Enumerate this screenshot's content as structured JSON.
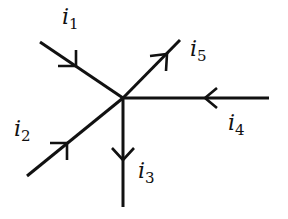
{
  "diagram": {
    "type": "circuit-node-currents",
    "stroke_color": "#111111",
    "junction": {
      "x": 123,
      "y": 98
    },
    "branches": [
      {
        "id": "i1",
        "symbol": "i",
        "subscript": "1",
        "direction": "into-node",
        "from": [
          40,
          42
        ],
        "to": [
          123,
          98
        ],
        "label_pos": [
          62,
          6
        ]
      },
      {
        "id": "i2",
        "symbol": "i",
        "subscript": "2",
        "direction": "into-node",
        "from": [
          27,
          176
        ],
        "to": [
          123,
          98
        ],
        "label_pos": [
          14,
          118
        ]
      },
      {
        "id": "i3",
        "symbol": "i",
        "subscript": "3",
        "direction": "out-of-node",
        "from": [
          123,
          98
        ],
        "to": [
          123,
          207
        ],
        "label_pos": [
          138,
          160
        ]
      },
      {
        "id": "i4",
        "symbol": "i",
        "subscript": "4",
        "direction": "into-node",
        "from": [
          269,
          98
        ],
        "to": [
          123,
          98
        ],
        "label_pos": [
          228,
          112
        ]
      },
      {
        "id": "i5",
        "symbol": "i",
        "subscript": "5",
        "direction": "out-of-node",
        "from": [
          123,
          98
        ],
        "to": [
          180,
          40
        ],
        "label_pos": [
          190,
          38
        ]
      }
    ]
  },
  "labels": {
    "i1": {
      "base": "i",
      "sub": "1"
    },
    "i2": {
      "base": "i",
      "sub": "2"
    },
    "i3": {
      "base": "i",
      "sub": "3"
    },
    "i4": {
      "base": "i",
      "sub": "4"
    },
    "i5": {
      "base": "i",
      "sub": "5"
    }
  }
}
